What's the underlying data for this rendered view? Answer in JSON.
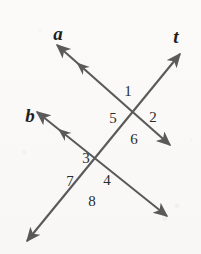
{
  "figure": {
    "background_color": "#fbfaf8",
    "stroke_color": "#5a5a5a",
    "label_color": "#2b2b2b",
    "line_label_color": "#1f1f1f"
  },
  "lines": [
    {
      "id": "line-a",
      "label": "a",
      "label_x": 58,
      "label_y": 33,
      "x1": 57,
      "y1": 45,
      "x2": 170,
      "y2": 145,
      "start_arrow": true,
      "end_arrow": true,
      "tick_arrow": true,
      "tick_t": 0.26
    },
    {
      "id": "line-b",
      "label": "b",
      "label_x": 30,
      "label_y": 115,
      "x1": 37,
      "y1": 112,
      "x2": 167,
      "y2": 216,
      "start_arrow": true,
      "end_arrow": true,
      "tick_arrow": true,
      "tick_t": 0.24
    },
    {
      "id": "line-t",
      "label": "t",
      "label_x": 176,
      "label_y": 36,
      "x1": 180,
      "y1": 54,
      "x2": 27,
      "y2": 241,
      "start_arrow": true,
      "end_arrow": true,
      "tick_arrow": false,
      "tick_t": 0
    }
  ],
  "intersections": [
    {
      "id": "upper-intersection",
      "x": 138,
      "y": 115,
      "lines": [
        "a",
        "t"
      ]
    },
    {
      "id": "lower-intersection",
      "x": 92,
      "y": 180,
      "lines": [
        "b",
        "t"
      ]
    }
  ],
  "angles": [
    {
      "id": "angle-1",
      "label": "1",
      "x": 128,
      "y": 91,
      "intersection": "upper-intersection",
      "position": "top"
    },
    {
      "id": "angle-2",
      "label": "2",
      "x": 153,
      "y": 117,
      "intersection": "upper-intersection",
      "position": "right"
    },
    {
      "id": "angle-5",
      "label": "5",
      "x": 113,
      "y": 118,
      "intersection": "upper-intersection",
      "position": "left"
    },
    {
      "id": "angle-6",
      "label": "6",
      "x": 134,
      "y": 139,
      "intersection": "upper-intersection",
      "position": "bottom"
    },
    {
      "id": "angle-3",
      "label": "3",
      "x": 86,
      "y": 158,
      "intersection": "lower-intersection",
      "position": "top"
    },
    {
      "id": "angle-4",
      "label": "4",
      "x": 107,
      "y": 180,
      "intersection": "lower-intersection",
      "position": "right"
    },
    {
      "id": "angle-7",
      "label": "7",
      "x": 70,
      "y": 181,
      "intersection": "lower-intersection",
      "position": "left"
    },
    {
      "id": "angle-8",
      "label": "8",
      "x": 92,
      "y": 201,
      "intersection": "lower-intersection",
      "position": "bottom"
    }
  ]
}
